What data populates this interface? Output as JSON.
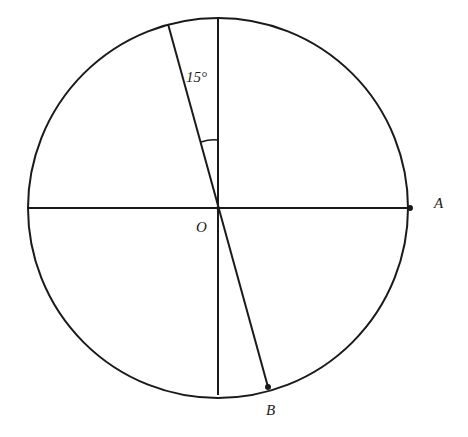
{
  "diagram": {
    "center": {
      "x": 218,
      "y": 208,
      "label": "O"
    },
    "radius": 190,
    "point_a": {
      "x": 410,
      "y": 208,
      "label": "A"
    },
    "point_b": {
      "x": 268,
      "y": 387,
      "label": "B"
    },
    "diameter_top": {
      "x": 168,
      "y": 24
    },
    "angle_label": "15°",
    "stroke_color": "#1a1a1a",
    "background": "#ffffff"
  }
}
